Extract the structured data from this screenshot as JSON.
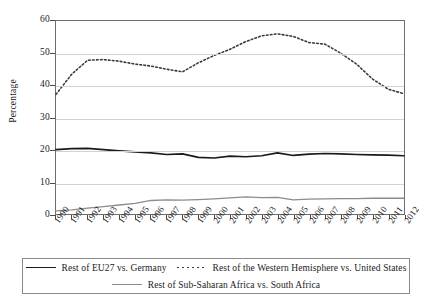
{
  "chart_data": {
    "type": "line",
    "title": "",
    "xlabel": "",
    "ylabel": "Percentage",
    "ylim": [
      0,
      60
    ],
    "y_ticks": [
      0,
      10,
      20,
      30,
      40,
      50,
      60
    ],
    "grid": true,
    "legend_position": "bottom",
    "x": [
      1990,
      1991,
      1992,
      1993,
      1994,
      1995,
      1996,
      1997,
      1998,
      1999,
      2000,
      2001,
      2002,
      2003,
      2004,
      2005,
      2006,
      2007,
      2008,
      2009,
      2010,
      2011,
      2012
    ],
    "categories": [
      "1990",
      "1991",
      "1992",
      "1993",
      "1994",
      "1995",
      "1996",
      "1997",
      "1998",
      "1999",
      "2000",
      "2001",
      "2002",
      "2003",
      "2004",
      "2005",
      "2006",
      "2007",
      "2008",
      "2009",
      "2010",
      "2011",
      "2012"
    ],
    "series": [
      {
        "name": "Rest of EU27 vs. Germany",
        "style": "solid",
        "color": "#1a1a1a",
        "values": [
          20.0,
          20.3,
          20.4,
          20.0,
          19.6,
          19.3,
          19.0,
          18.5,
          18.7,
          17.6,
          17.4,
          18.0,
          17.8,
          18.1,
          19.0,
          18.2,
          18.6,
          18.8,
          18.7,
          18.5,
          18.4,
          18.3,
          18.1
        ]
      },
      {
        "name": "Rest of the Western Hemisphere vs. United States",
        "style": "dotted",
        "color": "#3a3a3a",
        "values": [
          37.2,
          43.5,
          47.8,
          48.0,
          47.5,
          46.6,
          46.0,
          45.0,
          44.2,
          47.0,
          49.3,
          51.2,
          53.6,
          55.4,
          56.0,
          55.2,
          53.3,
          52.8,
          50.0,
          46.6,
          42.0,
          38.8,
          37.4
        ]
      },
      {
        "name": "Rest of Sub-Saharan Africa vs. South Africa",
        "style": "solid",
        "color": "#8c8c8c",
        "values": [
          1.0,
          1.3,
          1.8,
          2.3,
          2.8,
          3.3,
          4.2,
          4.4,
          4.3,
          4.5,
          4.7,
          5.0,
          5.3,
          5.1,
          5.2,
          4.4,
          4.6,
          4.7,
          4.8,
          4.8,
          4.9,
          4.9,
          4.9
        ]
      }
    ]
  },
  "legend": {
    "rows": [
      [
        {
          "label": "Rest of EU27  vs. Germany",
          "style": "solid",
          "color": "#1a1a1a"
        },
        {
          "label": "Rest of the Western Hemisphere vs. United States",
          "style": "dotted",
          "color": "#3a3a3a"
        }
      ],
      [
        {
          "label": "Rest of Sub-Saharan Africa vs. South Africa",
          "style": "solid",
          "color": "#8c8c8c"
        }
      ]
    ]
  }
}
